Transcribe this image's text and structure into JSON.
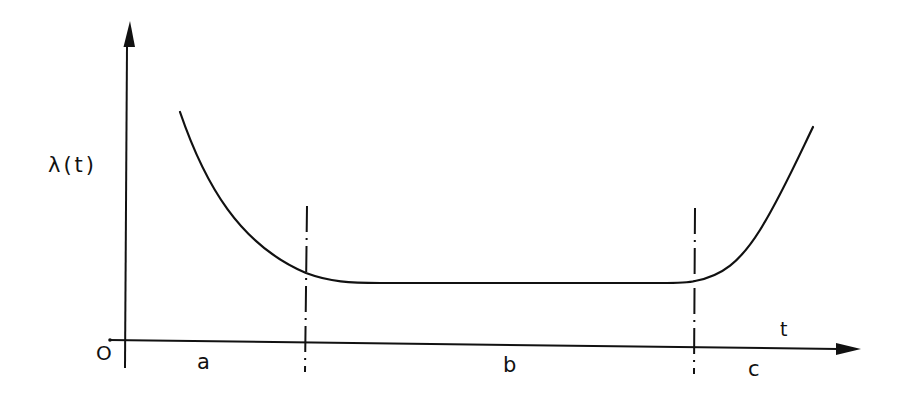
{
  "diagram": {
    "kind": "bathtub-curve",
    "y_axis_label": "λ(t)",
    "x_axis_label": "t",
    "origin_label": "O",
    "regions": [
      {
        "label": "a"
      },
      {
        "label": "b"
      },
      {
        "label": "c"
      }
    ],
    "colors": {
      "ink": "#111111",
      "background": "#ffffff"
    }
  }
}
